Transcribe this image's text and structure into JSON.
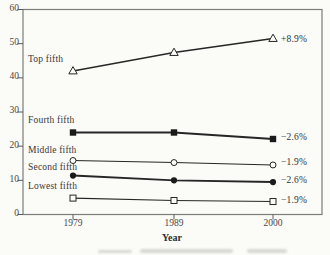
{
  "chart_data": {
    "type": "line",
    "title": "",
    "xlabel": "Year",
    "ylabel": "",
    "x_categories": [
      "1979",
      "1989",
      "2000"
    ],
    "ylim": [
      0,
      60
    ],
    "yticks": [
      0,
      10,
      20,
      30,
      40,
      50,
      60
    ],
    "grid": false,
    "legend_position": "in-plot labels above each series' 1979 point; change labels right of 2000 point",
    "series": [
      {
        "name": "Top fifth",
        "marker": "triangle-open",
        "values": [
          42.0,
          47.4,
          51.5
        ],
        "change_label": "+8.9%"
      },
      {
        "name": "Fourth fifth",
        "marker": "square-filled",
        "values": [
          24.0,
          24.0,
          22.1
        ],
        "change_label": "−2.6%"
      },
      {
        "name": "Middle fifth",
        "marker": "circle-open",
        "values": [
          15.8,
          15.2,
          14.5
        ],
        "change_label": "−1.9%"
      },
      {
        "name": "Second fifth",
        "marker": "circle-filled",
        "values": [
          11.4,
          10.0,
          9.5
        ],
        "change_label": "−2.6%"
      },
      {
        "name": "Lowest fifth",
        "marker": "square-open",
        "values": [
          4.8,
          4.1,
          3.8
        ],
        "change_label": "−1.9%"
      }
    ],
    "colors": {
      "line": "#262626",
      "marker_fill": "#1a1a1a",
      "open_fill": "#fbfbf8",
      "frame": "#7c7c7c",
      "paper": "#fbfbf8"
    }
  }
}
